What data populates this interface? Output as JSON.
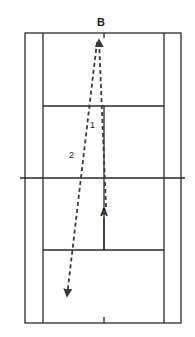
{
  "diagram": {
    "type": "tennis-court-shot-diagram",
    "colors": {
      "line": "#2a2a2a",
      "path": "#3a3a3a",
      "background": "#ffffff"
    },
    "court": {
      "outer": {
        "x1": 25,
        "y1": 33,
        "x2": 181,
        "y2": 323
      },
      "singles_left_x": 43,
      "singles_right_x": 164,
      "net": {
        "y": 178,
        "x1": 20,
        "x2": 185
      },
      "service_line_top_y": 106,
      "service_line_bottom_y": 250,
      "center_x": 104
    },
    "points": {
      "A": {
        "label": "A",
        "x": 104,
        "y": 213
      },
      "B": {
        "label": "B",
        "x": 101,
        "y": 24
      }
    },
    "paths": [
      {
        "id": "1",
        "label": "1",
        "from": "A",
        "to": "B",
        "style": "dashed",
        "x1": 106,
        "y1": 207,
        "x2": 99,
        "y2": 38,
        "label_x": 90,
        "label_y": 126
      },
      {
        "id": "2",
        "label": "2",
        "from": "B",
        "to": "back-court-left",
        "style": "dashed",
        "x1": 97,
        "y1": 40,
        "x2": 67,
        "y2": 298,
        "label_x": 70,
        "label_y": 156
      }
    ]
  }
}
